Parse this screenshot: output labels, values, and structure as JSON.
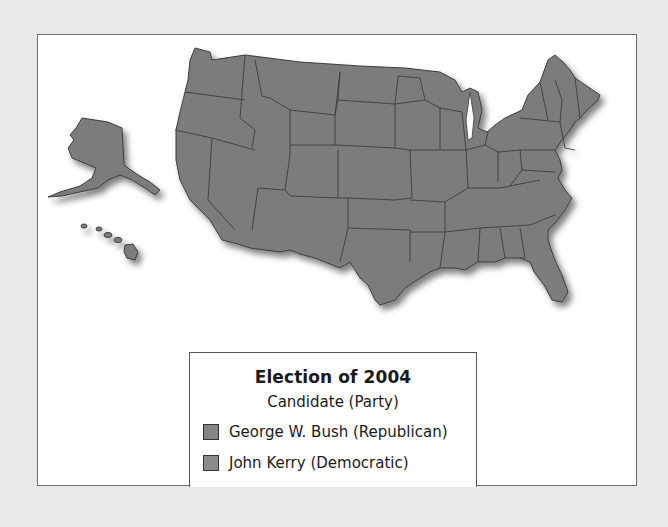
{
  "legend": {
    "title": "Election of 2004",
    "subtitle": "Candidate (Party)",
    "items": [
      {
        "label": "George W. Bush (Republican)",
        "color": "#858585"
      },
      {
        "label": "John Kerry (Democratic)",
        "color": "#8c8c8c"
      }
    ]
  },
  "map": {
    "land_color": "#7b7b7b",
    "border_color": "#3e3e3e",
    "regions": [
      "contiguous-us",
      "alaska",
      "hawaii"
    ]
  }
}
